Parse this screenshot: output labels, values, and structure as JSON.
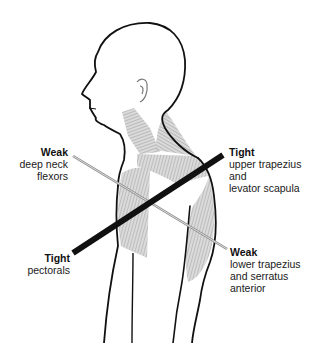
{
  "diagram": {
    "type": "anatomical-illustration",
    "colors": {
      "outline": "#111111",
      "muscle_fill": "#b8b8b8",
      "tight_line": "#111111",
      "weak_line": "#9a9a9a",
      "background": "#ffffff"
    },
    "labels": {
      "weak_neck": {
        "title": "Weak",
        "lines": [
          "deep neck",
          "flexors"
        ]
      },
      "tight_upper": {
        "title": "Tight",
        "lines": [
          "upper trapezius",
          "and",
          "levator scapula"
        ]
      },
      "tight_pecs": {
        "title": "Tight",
        "lines": [
          "pectorals"
        ]
      },
      "weak_lower": {
        "title": "Weak",
        "lines": [
          "lower trapezius",
          "and serratus",
          "anterior"
        ]
      }
    },
    "lines": {
      "tight": {
        "from": [
          73,
          253
        ],
        "to": [
          223,
          155
        ],
        "style": "thick-black"
      },
      "weak": {
        "from": [
          73,
          156
        ],
        "to": [
          227,
          249
        ],
        "style": "thin-gray"
      }
    }
  }
}
